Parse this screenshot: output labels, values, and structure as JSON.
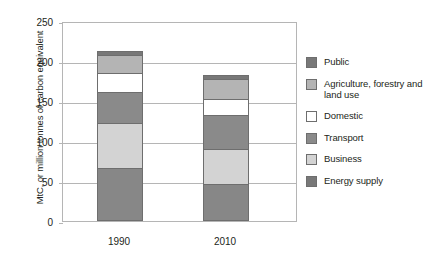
{
  "chart_data": {
    "type": "bar",
    "subtype": "stacked-vertical",
    "title": "",
    "xlabel": "",
    "ylabel": "MtC, or million tonnes of carbon equivalent",
    "categories": [
      "1990",
      "2010"
    ],
    "ylim": [
      0,
      250
    ],
    "yticks": [
      0,
      50,
      100,
      150,
      200,
      250
    ],
    "ytick_labels": [
      "0",
      "50",
      "100",
      "150",
      "200",
      "250"
    ],
    "grid": true,
    "legend_position": "right",
    "stack_order_bottom_to_top": [
      "Energy supply",
      "Business",
      "Transport",
      "Domestic",
      "Agriculture, forestry and land use",
      "Public"
    ],
    "series": [
      {
        "name": "Energy supply",
        "color": "#878787",
        "values": [
          66,
          46
        ]
      },
      {
        "name": "Business",
        "color": "#d3d3d3",
        "values": [
          56,
          44
        ]
      },
      {
        "name": "Transport",
        "color": "#8a8a8a",
        "values": [
          39,
          42
        ]
      },
      {
        "name": "Domestic",
        "color": "#ffffff",
        "values": [
          24,
          21
        ]
      },
      {
        "name": "Agriculture, forestry and land use",
        "color": "#b4b4b4",
        "values": [
          23,
          25
        ]
      },
      {
        "name": "Public",
        "color": "#787878",
        "values": [
          4,
          4
        ]
      }
    ],
    "totals": [
      212,
      182
    ]
  },
  "legend": {
    "items": [
      {
        "label": "Public",
        "color": "#787878"
      },
      {
        "label": "Agriculture, forestry and land use",
        "color": "#b4b4b4"
      },
      {
        "label": "Domestic",
        "color": "#ffffff"
      },
      {
        "label": "Transport",
        "color": "#8a8a8a"
      },
      {
        "label": "Business",
        "color": "#d3d3d3"
      },
      {
        "label": "Energy supply",
        "color": "#787878"
      }
    ]
  },
  "colors": {
    "axis": "#b5b5b5",
    "bar_outline": "#6e6e6e",
    "text": "#231f20",
    "plot_background": "#ffffff"
  }
}
